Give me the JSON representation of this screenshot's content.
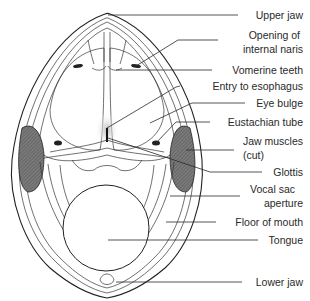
{
  "figure": {
    "labels": [
      {
        "id": "upper-jaw",
        "lines": [
          "Upper jaw"
        ],
        "x": 303,
        "y": [
          19
        ]
      },
      {
        "id": "opening-internal-naris",
        "lines": [
          "Opening of",
          "internal naris"
        ],
        "x": 303,
        "y": [
          39,
          53
        ]
      },
      {
        "id": "vomerine-teeth",
        "lines": [
          "Vomerine teeth"
        ],
        "x": 303,
        "y": [
          73
        ]
      },
      {
        "id": "entry-to-esophagus",
        "lines": [
          "Entry to esophagus"
        ],
        "x": 303,
        "y": [
          89
        ]
      },
      {
        "id": "eye-bulge",
        "lines": [
          "Eye bulge"
        ],
        "x": 303,
        "y": [
          107
        ]
      },
      {
        "id": "eustachian-tube",
        "lines": [
          "Eustachian tube"
        ],
        "x": 303,
        "y": [
          126
        ]
      },
      {
        "id": "jaw-muscles-cut",
        "lines": [
          "Jaw muscles",
          "(cut)"
        ],
        "x": 303,
        "y": [
          144,
          158
        ]
      },
      {
        "id": "glottis",
        "lines": [
          "Glottis"
        ],
        "x": 303,
        "y": [
          176
        ]
      },
      {
        "id": "vocal-sac-aperture",
        "lines": [
          "Vocal sac",
          "aperture"
        ],
        "x": 303,
        "y": [
          193,
          207
        ]
      },
      {
        "id": "floor-of-mouth",
        "lines": [
          "Floor of mouth"
        ],
        "x": 303,
        "y": [
          226
        ]
      },
      {
        "id": "tongue",
        "lines": [
          "Tongue"
        ],
        "x": 303,
        "y": [
          244
        ]
      },
      {
        "id": "lower-jaw",
        "lines": [
          "Lower jaw"
        ],
        "x": 303,
        "y": [
          286
        ]
      }
    ],
    "colors": {
      "ink": "#2a2a2a",
      "muscle_fill": "#6e6e6e",
      "background": "#ffffff"
    }
  }
}
